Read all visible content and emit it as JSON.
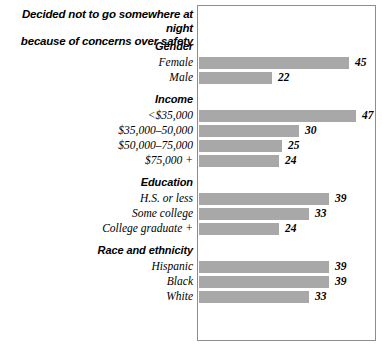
{
  "title": {
    "line1": "Decided not to go somewhere at night",
    "line2": "because of concerns over safety"
  },
  "colors": {
    "bar": "#a8a8a8",
    "frame": "#8d8d8d",
    "text": "#000000",
    "background": "#ffffff"
  },
  "chart_data": {
    "type": "bar",
    "orientation": "horizontal",
    "title": "Decided not to go somewhere at night because of concerns over safety",
    "xlabel": "",
    "ylabel": "",
    "xlim": [
      0,
      54
    ],
    "grid": false,
    "legend": false,
    "value_suffix": "",
    "groups": [
      {
        "name": "Gender",
        "categories": [
          "Female",
          "Male"
        ],
        "values": [
          45,
          22
        ]
      },
      {
        "name": "Income",
        "categories": [
          "<$35,000",
          "$35,000–50,000",
          "$50,000–75,000",
          "$75,000 +"
        ],
        "values": [
          47,
          30,
          25,
          24
        ]
      },
      {
        "name": "Education",
        "categories": [
          "H.S. or less",
          "Some college",
          "College graduate +"
        ],
        "values": [
          39,
          33,
          24
        ]
      },
      {
        "name": "Race and ethnicity",
        "categories": [
          "Hispanic",
          "Black",
          "White"
        ],
        "values": [
          39,
          39,
          33
        ]
      }
    ],
    "categories": [
      "Female",
      "Male",
      "<$35,000",
      "$35,000–50,000",
      "$50,000–75,000",
      "$75,000 +",
      "H.S. or less",
      "Some college",
      "College graduate +",
      "Hispanic",
      "Black",
      "White"
    ],
    "values": [
      45,
      22,
      47,
      30,
      25,
      24,
      39,
      33,
      24,
      39,
      39,
      33
    ]
  }
}
